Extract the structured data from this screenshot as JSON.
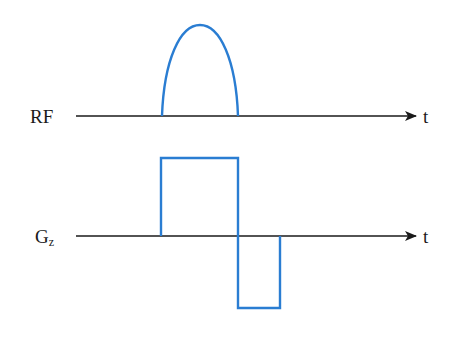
{
  "diagram": {
    "rows": [
      {
        "label": "RF",
        "axis_label": "t",
        "waveform": "half-sine RF pulse"
      },
      {
        "label": "G",
        "label_subscript": "z",
        "axis_label": "t",
        "waveform": "positive slice-select lobe followed by negative refocusing lobe"
      }
    ],
    "colors": {
      "waveform": "#2a7dd2",
      "axis": "#1a1a1a",
      "background": "#ffffff"
    }
  }
}
